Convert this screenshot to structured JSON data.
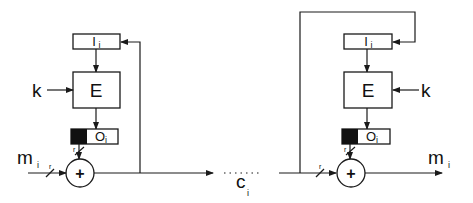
{
  "diagram": {
    "type": "block-cipher-mode-schematic",
    "colors": {
      "line": "#1a1a1a",
      "background": "#ffffff",
      "filled_segment": "#111111"
    },
    "encryptor": {
      "input_register": {
        "label": "I",
        "subscript": "i"
      },
      "cipher_block": {
        "label": "E"
      },
      "key": {
        "label": "k"
      },
      "output_register": {
        "label": "O",
        "subscript": "i"
      },
      "xor": {
        "symbol": "+"
      },
      "plaintext_input": {
        "label": "m",
        "subscript": "i"
      },
      "width_marks": [
        "r",
        "r"
      ]
    },
    "channel": {
      "ciphertext": {
        "label": "c",
        "subscript": "i"
      },
      "dots": "......"
    },
    "decryptor": {
      "input_register": {
        "label": "I",
        "subscript": "i"
      },
      "cipher_block": {
        "label": "E"
      },
      "key": {
        "label": "k"
      },
      "output_register": {
        "label": "O",
        "subscript": "i"
      },
      "xor": {
        "symbol": "+"
      },
      "plaintext_output": {
        "label": "m",
        "subscript": "i"
      },
      "width_marks": [
        "r",
        "r"
      ]
    }
  }
}
